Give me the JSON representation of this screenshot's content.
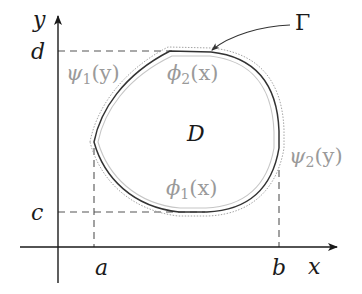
{
  "figure": {
    "axes": {
      "x_label": "x",
      "y_label": "y"
    },
    "ticks": {
      "x": [
        {
          "label": "a"
        },
        {
          "label": "b"
        }
      ],
      "y": [
        {
          "label": "c"
        },
        {
          "label": "d"
        }
      ]
    },
    "region": {
      "label": "D",
      "boundary_label": "Γ"
    },
    "curves": {
      "phi1": {
        "name": "ϕ",
        "sub": "1",
        "arg": "(x)"
      },
      "phi2": {
        "name": "ϕ",
        "sub": "2",
        "arg": "(x)"
      },
      "psi1": {
        "name": "ψ",
        "sub": "1",
        "arg": "(y)"
      },
      "psi2": {
        "name": "ψ",
        "sub": "2",
        "arg": "(y)"
      }
    },
    "colors": {
      "axis": "#1a1a1a",
      "boundary": "#333333",
      "inner_outline": "#bdbdbd",
      "outer_dotted": "#9a9a9a",
      "dashed": "#555555",
      "gray_label": "#9a9a9a"
    }
  }
}
